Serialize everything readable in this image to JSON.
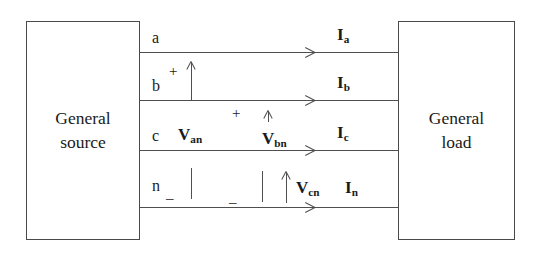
{
  "diagram": {
    "source_box": {
      "lines": [
        "General",
        "source"
      ]
    },
    "load_box": {
      "lines": [
        "General",
        "load"
      ]
    },
    "conductors": [
      {
        "phase_label": "a",
        "current_label": "I",
        "current_sub": "a"
      },
      {
        "phase_label": "b",
        "current_label": "I",
        "current_sub": "b"
      },
      {
        "phase_label": "c",
        "current_label": "I",
        "current_sub": "c"
      },
      {
        "phase_label": "n",
        "current_label": "I",
        "current_sub": "n"
      }
    ],
    "voltages": [
      {
        "symbol": "V",
        "sub": "an",
        "plus": "+",
        "minus": "_"
      },
      {
        "symbol": "V",
        "sub": "bn",
        "plus": "+",
        "minus": "_"
      },
      {
        "symbol": "V",
        "sub": "cn",
        "plus": "+",
        "minus": "_"
      }
    ],
    "colors": {
      "stroke": "#4f4f4f",
      "box_border": "#4a4a4a",
      "text": "#1a1a1a",
      "background": "#ffffff"
    }
  }
}
